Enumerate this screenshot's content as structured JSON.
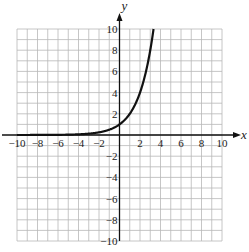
{
  "chart_data": {
    "type": "line",
    "title": "",
    "xlabel": "x",
    "ylabel": "y",
    "xlim": [
      -10,
      10
    ],
    "ylim": [
      -10,
      10
    ],
    "grid": true,
    "grid_step": 1,
    "x_ticks": [
      -10,
      -8,
      -6,
      -4,
      -2,
      2,
      4,
      6,
      8,
      10
    ],
    "y_ticks": [
      -10,
      -8,
      -6,
      -4,
      -2,
      2,
      4,
      6,
      8,
      10
    ],
    "x_tick_labels": [
      "−10",
      "−8",
      "−6",
      "−4",
      "−2",
      "2",
      "4",
      "6",
      "8",
      "10"
    ],
    "y_tick_labels": [
      "−10",
      "−8",
      "−6",
      "−4",
      "−2",
      "2",
      "4",
      "6",
      "8",
      "10"
    ],
    "series": [
      {
        "name": "y = 2^x",
        "x": [
          -10,
          -8,
          -6,
          -4,
          -3,
          -2,
          -1,
          0,
          1,
          2,
          3,
          3.32
        ],
        "y": [
          0.001,
          0.004,
          0.016,
          0.0625,
          0.125,
          0.25,
          0.5,
          1,
          2,
          4,
          8,
          10
        ]
      }
    ],
    "legend": null
  },
  "layout": {
    "plot_left": 17,
    "plot_right": 222,
    "plot_top": 29,
    "plot_bottom": 241,
    "origin_x": 119,
    "origin_y": 133,
    "grid_color": "#b8b8b8",
    "axis_color": "#111111",
    "curve_color": "#111111"
  }
}
